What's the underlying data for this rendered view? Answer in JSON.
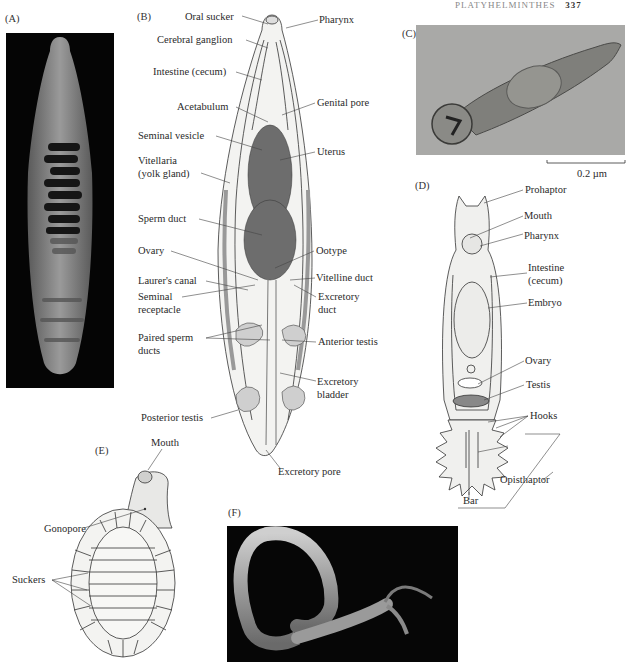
{
  "header": {
    "running_head": "PLATYHELMINTHES",
    "page_number": "337"
  },
  "panels": {
    "A": {
      "label": "(A)"
    },
    "B": {
      "label": "(B)",
      "left_labels": [
        "Oral sucker",
        "Cerebral ganglion",
        "Intestine (cecum)",
        "Acetabulum",
        "Seminal vesicle",
        "Vitellaria",
        "(yolk gland)",
        "Sperm duct",
        "Ovary",
        "Laurer's canal",
        "Seminal",
        "receptacle",
        "Paired sperm",
        "ducts",
        "Posterior testis"
      ],
      "right_labels": [
        "Pharynx",
        "Genital pore",
        "Uterus",
        "Ootype",
        "Vitelline duct",
        "Excretory",
        "duct",
        "Anterior testis",
        "Excretory",
        "bladder",
        "Excretory pore"
      ]
    },
    "C": {
      "label": "(C)",
      "scale_bar": "0.2 µm"
    },
    "D": {
      "label": "(D)",
      "labels": [
        "Prohaptor",
        "Mouth",
        "Pharynx",
        "Intestine",
        "(cecum)",
        "Embryo",
        "Ovary",
        "Testis",
        "Hooks",
        "Opisthaptor",
        "Bar"
      ]
    },
    "E": {
      "label": "(E)",
      "labels": [
        "Mouth",
        "Gonopore",
        "Suckers"
      ]
    },
    "F": {
      "label": "(F)"
    }
  }
}
